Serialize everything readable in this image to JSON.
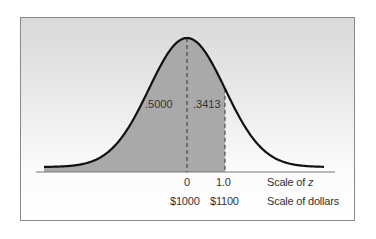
{
  "chart_data": {
    "type": "area",
    "title": "",
    "distribution": "standard normal curve",
    "shaded_regions": [
      {
        "from_z": "-inf",
        "to_z": 0,
        "area": ".5000",
        "label": ".5000"
      },
      {
        "from_z": 0,
        "to_z": 1.0,
        "area": ".3413",
        "label": ".3413"
      }
    ],
    "markers": [
      {
        "z": "0",
        "dollars": "$1000",
        "style": "dashed"
      },
      {
        "z": "1.0",
        "dollars": "$1100",
        "style": "dashed"
      }
    ],
    "axis_scales": [
      {
        "name": "Scale of z"
      },
      {
        "name": "Scale of dollars"
      }
    ],
    "mean_dollars": 1000,
    "sd_dollars": 100,
    "grid": false,
    "colors": {
      "shade": "#a9a9a9",
      "curve": "#111111",
      "background_top": "#d9d9d9",
      "background_bottom": "#ffffff"
    }
  },
  "labels": {
    "left_area": ".5000",
    "right_area": ".3413",
    "z_zero": "0",
    "z_one": "1.0",
    "z_scale": "Scale of ",
    "z_italic": "z",
    "dollar_zero": "$1000",
    "dollar_one": "$1100",
    "dollar_scale": "Scale of dollars"
  }
}
